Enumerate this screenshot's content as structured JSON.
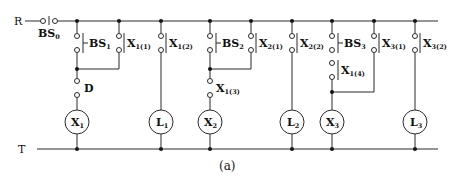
{
  "diagram": {
    "type": "relay ladder circuit",
    "caption": "(a)",
    "rails": {
      "top": {
        "label": "R",
        "y": 21
      },
      "bottom": {
        "label": "T",
        "y": 149
      }
    },
    "main_switch": {
      "label": "BS",
      "sub": "0",
      "type": "pushbutton"
    },
    "rungs": [
      {
        "id": "rung-x1",
        "coil": {
          "label": "X",
          "sub": "1",
          "x": 77
        },
        "parallel": [
          {
            "label": "BS",
            "sub": "1",
            "type": "pushbutton",
            "x": 77
          },
          {
            "label": "X",
            "sub": "1(1)",
            "type": "contact",
            "x": 119
          }
        ],
        "series": [
          {
            "label": "D",
            "sub": "",
            "type": "contact"
          }
        ]
      },
      {
        "id": "rung-l1",
        "coil": {
          "label": "L",
          "sub": "1",
          "x": 161
        },
        "parallel": [
          {
            "label": "X",
            "sub": "1(2)",
            "type": "contact",
            "x": 161
          }
        ],
        "series": []
      },
      {
        "id": "rung-x2",
        "coil": {
          "label": "X",
          "sub": "2",
          "x": 210
        },
        "parallel": [
          {
            "label": "BS",
            "sub": "2",
            "type": "pushbutton",
            "x": 210
          },
          {
            "label": "X",
            "sub": "2(1)",
            "type": "contact",
            "x": 251
          }
        ],
        "series": [
          {
            "label": "X",
            "sub": "1(3)",
            "type": "contact"
          }
        ]
      },
      {
        "id": "rung-l2",
        "coil": {
          "label": "L",
          "sub": "2",
          "x": 292
        },
        "parallel": [
          {
            "label": "X",
            "sub": "2(2)",
            "type": "contact",
            "x": 292
          }
        ],
        "series": []
      },
      {
        "id": "rung-x3",
        "coil": {
          "label": "X",
          "sub": "3",
          "x": 332
        },
        "parallel": [
          {
            "label": "BS",
            "sub": "3",
            "type": "pushbutton",
            "x": 332
          },
          {
            "label": "X",
            "sub": "3(1)",
            "type": "contact",
            "x": 374
          }
        ],
        "series_in_branch": [
          {
            "label": "X",
            "sub": "1(4)",
            "type": "contact"
          }
        ]
      },
      {
        "id": "rung-l3",
        "coil": {
          "label": "L",
          "sub": "3",
          "x": 415
        },
        "parallel": [
          {
            "label": "X",
            "sub": "3(2)",
            "type": "contact",
            "x": 415
          }
        ],
        "series": []
      }
    ]
  }
}
